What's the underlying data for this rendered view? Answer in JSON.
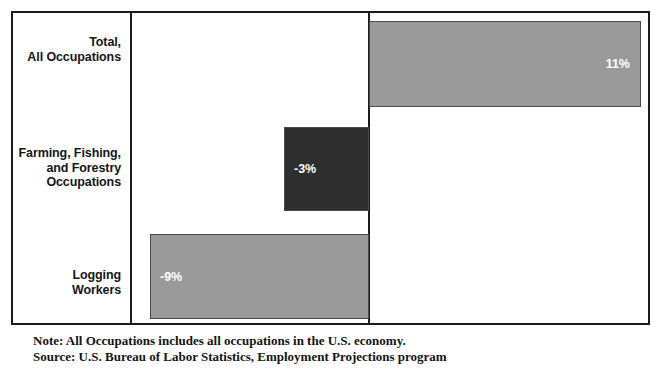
{
  "chart_data": {
    "type": "bar",
    "orientation": "horizontal",
    "title": "",
    "subtitle": "",
    "xlabel": "",
    "ylabel": "",
    "categories": [
      "Total,\nAll Occupations",
      "Farming, Fishing,\nand Forestry\nOccupations",
      "Logging\nWorkers"
    ],
    "values": [
      11,
      -3,
      -9
    ],
    "value_labels": [
      "11%",
      "-3%",
      "-9%"
    ],
    "bar_colors": [
      "#9a9a9a",
      "#2e2e2e",
      "#9a9a9a"
    ],
    "zero_line": 0,
    "xlim": [
      -12.5,
      12.5
    ],
    "grid": false,
    "legend": null,
    "annotations": []
  },
  "chart": {
    "bars": [
      {
        "category_line1": "Total,",
        "category_line2": "All Occupations",
        "category_line3": "",
        "value_label": "11%",
        "value": 11,
        "color": "#9a9a9a"
      },
      {
        "category_line1": "Farming, Fishing,",
        "category_line2": "and Forestry",
        "category_line3": "Occupations",
        "value_label": "-3%",
        "value": -3,
        "color": "#2e2e2e"
      },
      {
        "category_line1": "Logging",
        "category_line2": "Workers",
        "category_line3": "",
        "value_label": "-9%",
        "value": -9,
        "color": "#9a9a9a"
      }
    ]
  },
  "footnote": {
    "note": "Note: All Occupations includes all occupations in the U.S. economy.",
    "source": "Source: U.S. Bureau of Labor Statistics, Employment Projections program"
  },
  "colors": {
    "frame": "#1c1c1c",
    "bar_positive": "#9a9a9a",
    "bar_highlight": "#2e2e2e",
    "value_text": "#ffffff",
    "label_text": "#161616"
  }
}
